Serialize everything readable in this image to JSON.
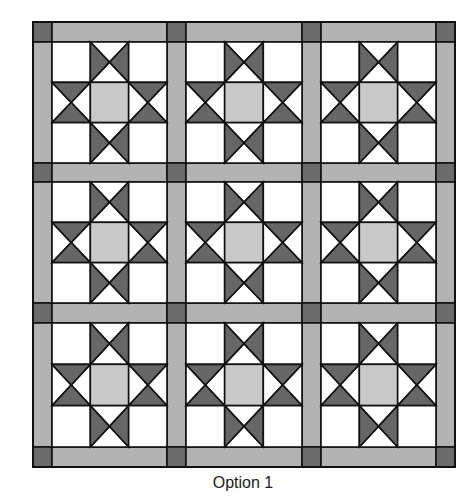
{
  "caption": "Option 1",
  "quilt": {
    "layout": "3x3 blocks with sashing and cornerstones",
    "block_name": "Ohio star variation",
    "rows": 3,
    "cols": 3,
    "col_edges": [
      33,
      52,
      167,
      186,
      302,
      321,
      436,
      455
    ],
    "row_edges": [
      22,
      42,
      163,
      182,
      303,
      323,
      447,
      467
    ],
    "colors": {
      "sashing": "#b3b3b3",
      "cornerstone": "#6b6b6b",
      "background": "#ffffff",
      "center_square": "#c9c9c9",
      "star_triangle": "#666666",
      "outline": "#111111"
    }
  }
}
